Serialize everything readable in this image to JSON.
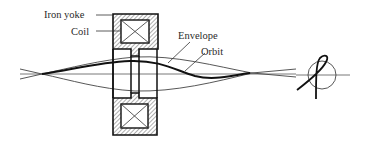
{
  "diagram": {
    "labels": {
      "iron_yoke": "Iron yoke",
      "coil": "Coil",
      "envelope": "Envelope",
      "orbit": "Orbit"
    },
    "colors": {
      "stroke": "#1a1a1a",
      "thin": "#444444",
      "background": "#ffffff"
    },
    "inset": {
      "description": "Projection of orbit rotation about axis",
      "icon": "rotation-loop-icon"
    }
  }
}
